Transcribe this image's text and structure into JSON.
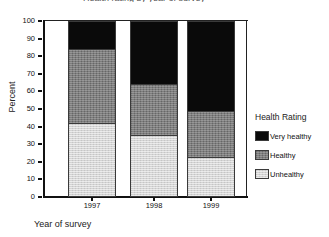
{
  "chart_data": {
    "type": "bar",
    "stacked": true,
    "stack_mode": "percent",
    "title": "Health rating by year of survey",
    "xlabel": "Year of survey",
    "ylabel": "Percent",
    "categories": [
      "1997",
      "1998",
      "1999"
    ],
    "ylim": [
      0,
      100
    ],
    "yticks": [
      "0",
      "10",
      "20",
      "30",
      "40",
      "50",
      "60",
      "70",
      "80",
      "90",
      "100"
    ],
    "grid": false,
    "legend_position": "right",
    "legend_title": "Health Rating",
    "series": [
      {
        "name": "Very healthy",
        "values": [
          16,
          36,
          51
        ],
        "color": "#0a0a0a"
      },
      {
        "name": "Healthy",
        "values": [
          42,
          29,
          26
        ],
        "color": "#7d7d7d"
      },
      {
        "name": "Unhealthy",
        "values": [
          42,
          35,
          23
        ],
        "color": "#d4d4d4"
      }
    ],
    "stack_tops": {
      "unhealthy": [
        42,
        35,
        23
      ],
      "healthy": [
        84,
        64,
        49
      ],
      "very_healthy": [
        100,
        100,
        100
      ]
    }
  },
  "axes": {
    "y_title": "Percent",
    "x_title": "Year of survey",
    "y_ticks": [
      "100",
      "90",
      "80",
      "70",
      "60",
      "50",
      "40",
      "30",
      "20",
      "10",
      "0"
    ],
    "x_ticks": [
      "1997",
      "1998",
      "1999"
    ]
  },
  "legend": {
    "title": "Health Rating",
    "items": [
      {
        "label": "Very healthy",
        "swatch": "black-swatch"
      },
      {
        "label": "Healthy",
        "swatch": "gray-swatch"
      },
      {
        "label": "Unhealthy",
        "swatch": "light-gray-swatch"
      }
    ]
  },
  "title": {
    "text": "Health rating by year of survey"
  }
}
